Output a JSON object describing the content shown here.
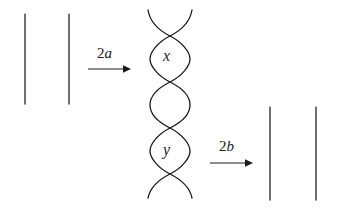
{
  "figure": {
    "background_color": "#ffffff",
    "ink_color": "#1a1a1a",
    "left_group": {
      "name": "two parallel vertical strands",
      "strand_count": 2
    },
    "braid_group": {
      "name": "braided strand pair with labelled lens regions",
      "strand_count": 2,
      "crossing_count": 5,
      "lens_labels": [
        "x",
        "y"
      ]
    },
    "right_group": {
      "name": "two parallel vertical strands",
      "strand_count": 2
    },
    "labels": {
      "lens_x": "x",
      "lens_y": "y",
      "arrow_first_coefficient": "2",
      "arrow_first_variable": "a",
      "arrow_second_coefficient": "2",
      "arrow_second_variable": "b"
    }
  }
}
